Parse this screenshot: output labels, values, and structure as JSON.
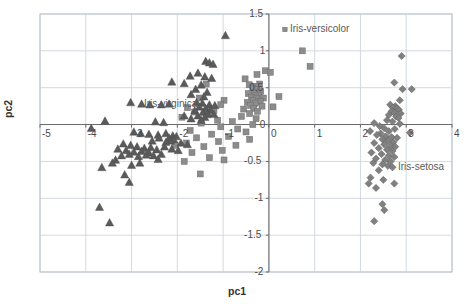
{
  "chart_data": {
    "type": "scatter",
    "title": "",
    "xlabel": "pc1",
    "ylabel": "pc2",
    "xlim": [
      -5,
      4
    ],
    "ylim": [
      -2,
      1.5
    ],
    "xticks": [
      "-5",
      "-4",
      "-3",
      "-2",
      "-1",
      "0",
      "1",
      "2",
      "3",
      "4"
    ],
    "xtick_values": [
      -5,
      -4,
      -3,
      -2,
      -1,
      0,
      1,
      2,
      3,
      4
    ],
    "yticks": [
      "1.5",
      "1",
      "0.5",
      "0",
      "-0.5",
      "-1",
      "-1.5",
      "-2"
    ],
    "ytick_values": [
      1.5,
      1,
      0.5,
      0,
      -0.5,
      -1,
      -1.5,
      -2
    ],
    "grid": true,
    "legend_position": "inline-annotations",
    "annotations": [
      {
        "text": "Iris-versicolor",
        "x": 0.35,
        "y": 1.29,
        "marker": "square"
      },
      {
        "text": "Iris-virginica",
        "x": -2.73,
        "y": 0.28,
        "marker": "none"
      },
      {
        "text": "Iris-setosa",
        "x": 2.82,
        "y": -0.57,
        "marker": "none"
      }
    ],
    "series": [
      {
        "name": "Iris-setosa",
        "marker": "diamond",
        "color": "#808080",
        "points": [
          [
            2.9,
            0.93
          ],
          [
            2.74,
            0.57
          ],
          [
            2.92,
            0.48
          ],
          [
            3.12,
            0.48
          ],
          [
            2.86,
            0.33
          ],
          [
            2.65,
            0.27
          ],
          [
            2.76,
            0.25
          ],
          [
            2.71,
            0.23
          ],
          [
            2.8,
            0.22
          ],
          [
            2.84,
            0.2
          ],
          [
            2.68,
            0.18
          ],
          [
            2.74,
            0.16
          ],
          [
            2.88,
            0.15
          ],
          [
            2.62,
            0.13
          ],
          [
            2.78,
            0.11
          ],
          [
            2.83,
            0.09
          ],
          [
            2.58,
            0.06
          ],
          [
            2.7,
            0.04
          ],
          [
            2.3,
            0.02
          ],
          [
            2.86,
            0.01
          ],
          [
            2.42,
            -0.02
          ],
          [
            2.52,
            -0.05
          ],
          [
            2.75,
            -0.06
          ],
          [
            2.21,
            -0.09
          ],
          [
            2.62,
            -0.09
          ],
          [
            2.44,
            -0.12
          ],
          [
            3.08,
            -0.11
          ],
          [
            2.36,
            -0.14
          ],
          [
            2.55,
            -0.16
          ],
          [
            2.68,
            -0.17
          ],
          [
            2.8,
            -0.18
          ],
          [
            2.48,
            -0.2
          ],
          [
            2.6,
            -0.22
          ],
          [
            2.72,
            -0.24
          ],
          [
            2.3,
            -0.25
          ],
          [
            2.52,
            -0.27
          ],
          [
            2.66,
            -0.29
          ],
          [
            2.76,
            -0.3
          ],
          [
            2.4,
            -0.32
          ],
          [
            2.58,
            -0.34
          ],
          [
            2.7,
            -0.36
          ],
          [
            2.24,
            -0.38
          ],
          [
            2.46,
            -0.4
          ],
          [
            2.62,
            -0.42
          ],
          [
            2.74,
            -0.44
          ],
          [
            2.34,
            -0.46
          ],
          [
            2.54,
            -0.48
          ],
          [
            2.66,
            -0.5
          ],
          [
            2.28,
            -0.52
          ],
          [
            2.48,
            -0.54
          ],
          [
            2.6,
            -0.56
          ],
          [
            2.7,
            -0.58
          ],
          [
            2.4,
            -0.62
          ],
          [
            2.22,
            -0.72
          ],
          [
            2.5,
            -0.75
          ],
          [
            2.18,
            -0.8
          ],
          [
            2.74,
            -0.8
          ],
          [
            2.34,
            -0.86
          ],
          [
            2.48,
            -1.08
          ],
          [
            2.52,
            -1.16
          ],
          [
            2.3,
            -1.31
          ]
        ]
      },
      {
        "name": "Iris-versicolor",
        "marker": "square",
        "color": "#8c8c8c",
        "points": [
          [
            0.73,
            1.0
          ],
          [
            0.9,
            0.79
          ],
          [
            -0.08,
            0.73
          ],
          [
            0.03,
            0.71
          ],
          [
            -0.26,
            0.68
          ],
          [
            -0.52,
            0.62
          ],
          [
            -0.2,
            0.55
          ],
          [
            -0.43,
            0.54
          ],
          [
            -0.3,
            0.52
          ],
          [
            -1.37,
            0.55
          ],
          [
            -0.35,
            0.49
          ],
          [
            -0.26,
            0.47
          ],
          [
            -0.18,
            0.45
          ],
          [
            -0.34,
            0.43
          ],
          [
            -0.45,
            0.42
          ],
          [
            -0.22,
            0.4
          ],
          [
            -0.3,
            0.39
          ],
          [
            -0.38,
            0.37
          ],
          [
            -0.12,
            0.36
          ],
          [
            0.22,
            0.38
          ],
          [
            -0.27,
            0.35
          ],
          [
            -1.52,
            0.36
          ],
          [
            -0.98,
            0.33
          ],
          [
            -0.35,
            0.33
          ],
          [
            -0.19,
            0.31
          ],
          [
            -0.47,
            0.3
          ],
          [
            -0.3,
            0.29
          ],
          [
            -1.05,
            0.27
          ],
          [
            -0.4,
            0.26
          ],
          [
            -0.15,
            0.25
          ],
          [
            -1.78,
            0.23
          ],
          [
            0.09,
            0.24
          ],
          [
            -0.33,
            0.22
          ],
          [
            -0.55,
            0.21
          ],
          [
            -1.2,
            0.19
          ],
          [
            -0.25,
            0.18
          ],
          [
            -1.62,
            0.17
          ],
          [
            -0.42,
            0.15
          ],
          [
            -1.35,
            0.13
          ],
          [
            -0.6,
            0.11
          ],
          [
            -1.9,
            0.1
          ],
          [
            -0.28,
            0.08
          ],
          [
            -1.12,
            0.06
          ],
          [
            -0.8,
            0.04
          ],
          [
            -1.48,
            0.02
          ],
          [
            -0.35,
            0.0
          ],
          [
            -1.05,
            -0.03
          ],
          [
            -0.68,
            -0.06
          ],
          [
            -1.72,
            -0.08
          ],
          [
            -0.5,
            -0.1
          ],
          [
            -1.25,
            -0.13
          ],
          [
            -0.88,
            -0.16
          ],
          [
            -1.58,
            -0.18
          ],
          [
            -0.42,
            -0.2
          ],
          [
            -1.1,
            -0.23
          ],
          [
            -1.8,
            -0.25
          ],
          [
            -0.72,
            -0.28
          ],
          [
            -1.42,
            -0.3
          ],
          [
            -2.05,
            -0.28
          ],
          [
            -1.02,
            -0.35
          ],
          [
            -1.68,
            -0.38
          ],
          [
            -1.3,
            -0.45
          ],
          [
            -0.98,
            -0.48
          ],
          [
            -1.85,
            -0.5
          ],
          [
            -1.5,
            -0.67
          ]
        ]
      },
      {
        "name": "Iris-virginica",
        "marker": "triangle",
        "color": "#5a5a5a",
        "points": [
          [
            -0.95,
            1.21
          ],
          [
            -1.38,
            0.86
          ],
          [
            -1.3,
            0.84
          ],
          [
            -1.22,
            0.82
          ],
          [
            -1.55,
            0.7
          ],
          [
            -1.72,
            0.66
          ],
          [
            -1.4,
            0.65
          ],
          [
            -1.25,
            0.63
          ],
          [
            -2.12,
            0.58
          ],
          [
            -1.85,
            0.56
          ],
          [
            -1.48,
            0.54
          ],
          [
            -1.6,
            0.48
          ],
          [
            -1.35,
            0.44
          ],
          [
            -1.7,
            0.41
          ],
          [
            -1.42,
            0.38
          ],
          [
            -3.02,
            0.3
          ],
          [
            -2.78,
            0.28
          ],
          [
            -2.6,
            0.27
          ],
          [
            -2.35,
            0.27
          ],
          [
            -2.18,
            0.28
          ],
          [
            -1.58,
            0.3
          ],
          [
            -1.45,
            0.29
          ],
          [
            -1.3,
            0.27
          ],
          [
            -1.18,
            0.26
          ],
          [
            -1.52,
            0.24
          ],
          [
            -1.38,
            0.22
          ],
          [
            -1.28,
            0.2
          ],
          [
            -1.62,
            0.19
          ],
          [
            -1.44,
            0.17
          ],
          [
            -1.33,
            0.15
          ],
          [
            -1.2,
            0.14
          ],
          [
            -1.55,
            0.12
          ],
          [
            -1.4,
            0.1
          ],
          [
            -1.7,
            0.08
          ],
          [
            -1.48,
            0.06
          ],
          [
            -3.58,
            0.05
          ],
          [
            -2.48,
            0.04
          ],
          [
            -2.3,
            0.03
          ],
          [
            -1.85,
            0.12
          ],
          [
            -3.88,
            -0.05
          ],
          [
            -2.95,
            -0.1
          ],
          [
            -2.8,
            -0.12
          ],
          [
            -2.62,
            -0.13
          ],
          [
            -2.42,
            -0.14
          ],
          [
            -2.25,
            -0.12
          ],
          [
            -2.1,
            -0.15
          ],
          [
            -2.02,
            -0.16
          ],
          [
            -2.18,
            -0.18
          ],
          [
            -2.08,
            -0.2
          ],
          [
            -2.15,
            -0.22
          ],
          [
            -2.25,
            -0.24
          ],
          [
            -2.4,
            -0.18
          ],
          [
            -1.92,
            -0.25
          ],
          [
            -1.78,
            -0.27
          ],
          [
            -2.55,
            -0.22
          ],
          [
            -3.18,
            -0.26
          ],
          [
            -3.02,
            -0.28
          ],
          [
            -2.88,
            -0.3
          ],
          [
            -2.72,
            -0.32
          ],
          [
            -2.58,
            -0.31
          ],
          [
            -3.3,
            -0.33
          ],
          [
            -3.12,
            -0.35
          ],
          [
            -2.95,
            -0.37
          ],
          [
            -2.78,
            -0.36
          ],
          [
            -2.62,
            -0.38
          ],
          [
            -2.45,
            -0.34
          ],
          [
            -2.28,
            -0.3
          ],
          [
            -2.12,
            -0.33
          ],
          [
            -1.98,
            -0.35
          ],
          [
            -2.35,
            -0.4
          ],
          [
            -2.52,
            -0.42
          ],
          [
            -2.68,
            -0.41
          ],
          [
            -2.85,
            -0.43
          ],
          [
            -3.05,
            -0.4
          ],
          [
            -3.22,
            -0.42
          ],
          [
            -2.42,
            -0.47
          ],
          [
            -3.35,
            -0.48
          ],
          [
            -3.42,
            -0.52
          ],
          [
            -3.0,
            -0.55
          ],
          [
            -2.82,
            -0.52
          ],
          [
            -3.65,
            -0.58
          ],
          [
            -3.15,
            -0.68
          ],
          [
            -3.05,
            -0.78
          ],
          [
            -3.7,
            -1.12
          ],
          [
            -3.48,
            -1.33
          ]
        ]
      }
    ]
  },
  "geometry": {
    "plot_left": 40,
    "plot_right": 452,
    "plot_top": 14,
    "plot_bottom": 272
  }
}
